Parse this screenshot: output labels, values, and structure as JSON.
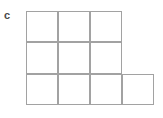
{
  "figure": {
    "label": "c",
    "label_color": "#4a4a4a",
    "background_color": "#ffffff",
    "width": 163,
    "height": 118
  },
  "grid": {
    "line_color": "#a2a2a2",
    "line_width": 1,
    "cell_fill": "#ffffff",
    "cell_width": 32,
    "cell_height": 31.3,
    "origin_x": 26,
    "origin_y": 11,
    "columns": 4,
    "rows": 3,
    "total_cells": 10,
    "x_positions": [
      26,
      58,
      90,
      122,
      154
    ],
    "y_positions": [
      11,
      42.3,
      73.7,
      105
    ],
    "shape_description": "L-shaped polyomino: 3 cells wide on top two rows, 4 cells wide on bottom row",
    "row_cell_counts": [
      3,
      3,
      4
    ],
    "cells": [
      {
        "row": 0,
        "col": 0
      },
      {
        "row": 0,
        "col": 1
      },
      {
        "row": 0,
        "col": 2
      },
      {
        "row": 1,
        "col": 0
      },
      {
        "row": 1,
        "col": 1
      },
      {
        "row": 1,
        "col": 2
      },
      {
        "row": 2,
        "col": 0
      },
      {
        "row": 2,
        "col": 1
      },
      {
        "row": 2,
        "col": 2
      },
      {
        "row": 2,
        "col": 3
      }
    ]
  }
}
